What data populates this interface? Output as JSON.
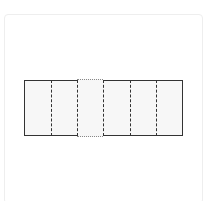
{
  "diagram": {
    "type": "partitioned-rectangle",
    "total_parts": 6,
    "highlighted_part_index": 2,
    "colors": {
      "outline": "#333333",
      "fill": "#f7f7f7",
      "highlight_edge": "#888888",
      "card_border": "#eeeeee"
    },
    "parts": [
      {
        "index": 0,
        "style": "normal"
      },
      {
        "index": 1,
        "style": "normal"
      },
      {
        "index": 2,
        "style": "dotted-edge"
      },
      {
        "index": 3,
        "style": "normal"
      },
      {
        "index": 4,
        "style": "normal"
      },
      {
        "index": 5,
        "style": "normal"
      }
    ]
  }
}
